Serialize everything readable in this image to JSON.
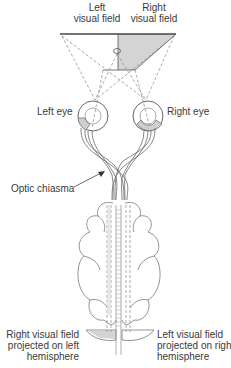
{
  "labels": {
    "left_field": [
      "Left",
      "visual field"
    ],
    "right_field": [
      "Right",
      "visual field"
    ],
    "left_eye": "Left eye",
    "right_eye": "Right eye",
    "optic_chiasma": "Optic chiasma",
    "right_projection": [
      "Right visual field",
      "projected on left",
      "hemisphere"
    ],
    "left_projection": [
      "Left visual field",
      "projected on right",
      "hemisphere"
    ]
  },
  "colors": {
    "shade": "#d4d4d4",
    "line": "#555555",
    "dash": "#888888"
  }
}
